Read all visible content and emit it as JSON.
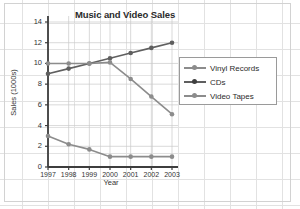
{
  "chart_data": {
    "type": "line",
    "title": "Music and Video Sales",
    "xlabel": "Year",
    "ylabel": "Sales (1000s)",
    "categories": [
      "1997",
      "1998",
      "1999",
      "2000",
      "2001",
      "2002",
      "2003"
    ],
    "ylim": [
      0,
      14
    ],
    "yticks": [
      "0",
      "2",
      "4",
      "6",
      "8",
      "10",
      "12",
      "14"
    ],
    "grid": true,
    "legend_position": "right",
    "series": [
      {
        "name": "Vinyl Records",
        "color": "#8c8c8c",
        "values": [
          3.0,
          2.2,
          1.7,
          1.0,
          1.0,
          1.0,
          1.0
        ]
      },
      {
        "name": "CDs",
        "color": "#5f5f5f",
        "values": [
          9.0,
          9.5,
          10.0,
          10.5,
          11.0,
          11.5,
          12.0
        ]
      },
      {
        "name": "Video Tapes",
        "color": "#8c8c8c",
        "values": [
          10.0,
          10.0,
          10.0,
          10.1,
          8.5,
          6.8,
          5.1
        ]
      }
    ]
  },
  "legend": {
    "items": [
      {
        "label": "Vinyl Records"
      },
      {
        "label": "CDs"
      },
      {
        "label": "Video Tapes"
      }
    ]
  },
  "colors": {
    "axis": "#3d3d3d",
    "grid": "#c9c9c9",
    "page_grid": "#e2e2e2",
    "text": "#333333",
    "title": "#2b2b2b"
  }
}
